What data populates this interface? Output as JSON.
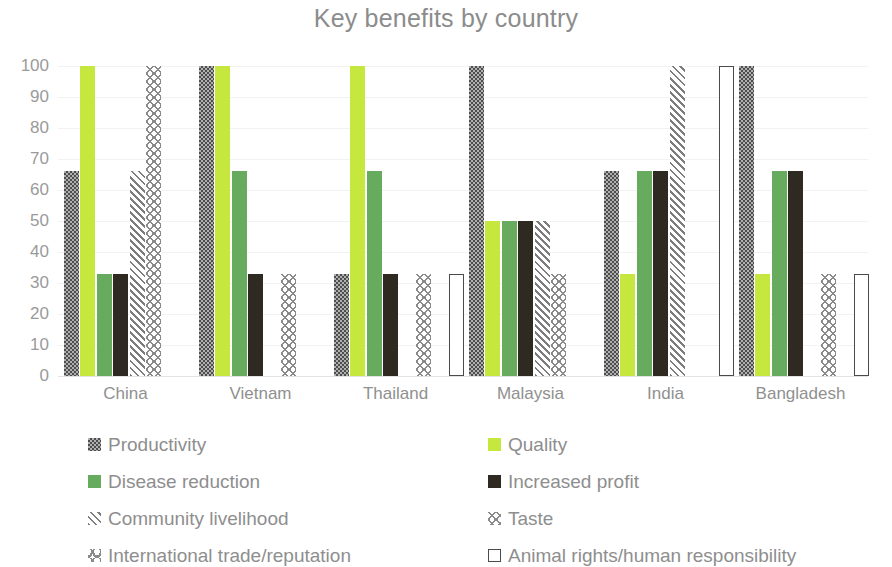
{
  "chart_data": {
    "type": "bar",
    "title": "Key benefits by country",
    "xlabel": "",
    "ylabel": "",
    "ylim": [
      0,
      100
    ],
    "yticks": [
      100,
      90,
      80,
      70,
      60,
      50,
      40,
      30,
      20,
      10,
      0
    ],
    "grid": true,
    "legend_position": "bottom",
    "categories": [
      "China",
      "Vietnam",
      "Thailand",
      "Malaysia",
      "India",
      "Bangladesh"
    ],
    "series": [
      {
        "name": "Productivity",
        "color": "#4d4d4d",
        "pattern": "checker",
        "values": [
          66,
          100,
          33,
          100,
          66,
          100
        ]
      },
      {
        "name": "Quality",
        "color": "#c6e73e",
        "pattern": "solid",
        "values": [
          100,
          100,
          100,
          50,
          33,
          33
        ]
      },
      {
        "name": "Disease reduction",
        "color": "#66ab5e",
        "pattern": "solid",
        "values": [
          33,
          66,
          66,
          50,
          66,
          66
        ]
      },
      {
        "name": "Increased profit",
        "color": "#2e2a22",
        "pattern": "solid",
        "values": [
          33,
          33,
          33,
          50,
          66,
          66
        ]
      },
      {
        "name": "Community livelihood",
        "color": "#7d7d7d",
        "pattern": "diagonal",
        "values": [
          66,
          0,
          0,
          50,
          100,
          0
        ]
      },
      {
        "name": "Taste",
        "color": "#8a8a8a",
        "pattern": "chevron",
        "values": [
          100,
          33,
          33,
          33,
          0,
          33
        ]
      },
      {
        "name": "International trade/reputation",
        "color": "#8a8a8a",
        "pattern": "chevron-up",
        "values": [
          0,
          0,
          0,
          0,
          0,
          0
        ]
      },
      {
        "name": "Animal rights/human responsibility",
        "color": "#4a4a4a",
        "pattern": "outline",
        "values": [
          0,
          0,
          33,
          0,
          100,
          33
        ]
      }
    ]
  },
  "legend": {
    "rows": [
      {
        "left": "Productivity",
        "right": "Quality"
      },
      {
        "left": "Disease reduction",
        "right": "Increased profit"
      },
      {
        "left": "Community livelihood",
        "right": "Taste"
      },
      {
        "left": "International trade/reputation",
        "right": "Animal rights/human responsibility"
      }
    ]
  }
}
